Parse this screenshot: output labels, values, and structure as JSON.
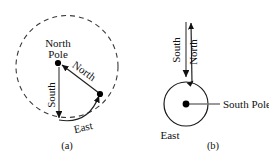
{
  "figure": {
    "caption_a": "(a)",
    "caption_b": "(b)",
    "panel_a": {
      "labels": {
        "north_pole": "North",
        "north_pole_2": "Pole",
        "north": "North",
        "south": "South",
        "east": "East"
      },
      "geometry": {
        "dashed_circle": {
          "cx": 67,
          "cy": 66.5,
          "r": 51
        },
        "pole_dot": {
          "x": 58,
          "y": 63
        },
        "point_dot": {
          "x": 100,
          "y": 94
        },
        "south_arrow_tip": {
          "x": 59,
          "y": 120
        }
      }
    },
    "panel_b": {
      "labels": {
        "south": "South",
        "north": "North",
        "east": "East",
        "south_pole": "South Pole"
      },
      "geometry": {
        "solid_circle": {
          "cx": 186,
          "cy": 104,
          "r": 22
        },
        "center_dot": {
          "x": 186,
          "y": 104
        },
        "north_arrow_tip": {
          "x": 191,
          "y": 20
        },
        "south_arrow_tip": {
          "x": 186,
          "y": 79
        }
      }
    }
  },
  "colors": {
    "ink": "#111111",
    "dash_stroke": "#3a3a3a",
    "arrow_stroke": "#555555",
    "background": "#ffffff"
  }
}
